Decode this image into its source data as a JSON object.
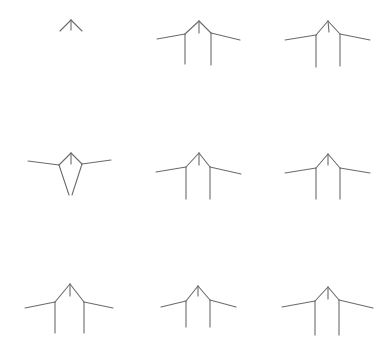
{
  "grid": {
    "rows": 3,
    "cols": 3,
    "background": "#ffffff",
    "line_color": "#6b6b6b"
  },
  "figures": [
    {
      "id": 1,
      "segments": [
        [
          71,
          20,
          60,
          31
        ],
        [
          71,
          20,
          82,
          31
        ],
        [
          71,
          20,
          71,
          30
        ]
      ]
    },
    {
      "id": 2,
      "segments": [
        [
          199,
          21,
          185,
          34
        ],
        [
          199,
          21,
          211,
          33
        ],
        [
          199,
          21,
          199,
          33
        ],
        [
          185,
          34,
          157,
          39
        ],
        [
          211,
          33,
          240,
          40
        ],
        [
          185,
          34,
          185,
          64
        ],
        [
          211,
          33,
          211,
          65
        ]
      ]
    },
    {
      "id": 3,
      "segments": [
        [
          328,
          21,
          316,
          35
        ],
        [
          328,
          21,
          340,
          34
        ],
        [
          328,
          21,
          329,
          32
        ],
        [
          316,
          35,
          285,
          40
        ],
        [
          340,
          34,
          370,
          40
        ],
        [
          316,
          35,
          316,
          67
        ],
        [
          340,
          34,
          340,
          66
        ]
      ]
    },
    {
      "id": 4,
      "segments": [
        [
          71,
          153,
          59,
          165
        ],
        [
          71,
          153,
          82,
          164
        ],
        [
          71,
          153,
          71,
          164
        ],
        [
          59,
          165,
          28,
          161
        ],
        [
          82,
          164,
          111,
          160
        ],
        [
          59,
          165,
          69,
          195
        ],
        [
          82,
          164,
          72,
          195
        ]
      ]
    },
    {
      "id": 5,
      "segments": [
        [
          199,
          153,
          186,
          167
        ],
        [
          199,
          153,
          210,
          167
        ],
        [
          199,
          153,
          199,
          165
        ],
        [
          186,
          167,
          156,
          172
        ],
        [
          210,
          167,
          241,
          174
        ],
        [
          186,
          167,
          186,
          199
        ],
        [
          210,
          167,
          210,
          199
        ]
      ]
    },
    {
      "id": 6,
      "segments": [
        [
          328,
          154,
          316,
          168
        ],
        [
          328,
          154,
          340,
          168
        ],
        [
          328,
          154,
          328,
          165
        ],
        [
          316,
          168,
          285,
          173
        ],
        [
          340,
          168,
          370,
          173
        ],
        [
          316,
          168,
          316,
          199
        ],
        [
          340,
          168,
          340,
          199
        ]
      ]
    },
    {
      "id": 7,
      "segments": [
        [
          70,
          284,
          55,
          302
        ],
        [
          70,
          284,
          84,
          302
        ],
        [
          70,
          284,
          70,
          296
        ],
        [
          55,
          302,
          25,
          308
        ],
        [
          84,
          302,
          113,
          308
        ],
        [
          55,
          302,
          55,
          333
        ],
        [
          84,
          302,
          84,
          333
        ]
      ]
    },
    {
      "id": 8,
      "segments": [
        [
          198,
          286,
          186,
          301
        ],
        [
          198,
          286,
          210,
          300
        ],
        [
          198,
          286,
          198,
          296
        ],
        [
          186,
          301,
          161,
          307
        ],
        [
          210,
          300,
          236,
          307
        ],
        [
          186,
          301,
          186,
          327
        ],
        [
          210,
          300,
          210,
          327
        ]
      ]
    },
    {
      "id": 9,
      "segments": [
        [
          328,
          287,
          315,
          301
        ],
        [
          328,
          287,
          339,
          300
        ],
        [
          328,
          287,
          328,
          299
        ],
        [
          315,
          301,
          282,
          307
        ],
        [
          339,
          300,
          373,
          308
        ],
        [
          315,
          301,
          315,
          335
        ],
        [
          339,
          300,
          339,
          335
        ]
      ]
    }
  ]
}
